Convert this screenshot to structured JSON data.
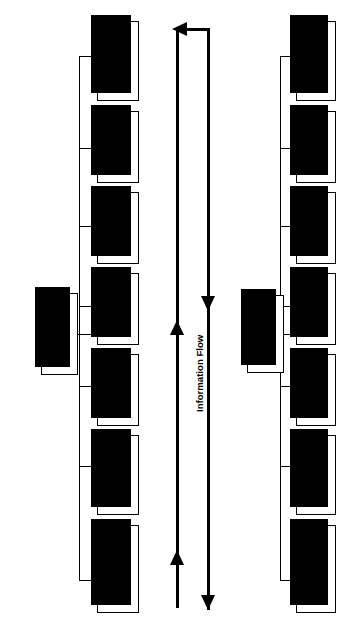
{
  "diagram": {
    "orientation": "rotated-90",
    "flow_label": "Information Flow",
    "transmitter": {
      "group_label": "Transmitter",
      "blocks": [
        {
          "label": "Transmitting\nAntenna"
        },
        {
          "label": "RF\nTransmitter"
        },
        {
          "label": "Up-\nConverter"
        },
        {
          "label": "IF\nTransmitter"
        },
        {
          "label": "Modulator"
        },
        {
          "label": "Code-\nInterleaver"
        },
        {
          "label": "Baseband\nProcessor"
        }
      ]
    },
    "receiver": {
      "group_label": "Receiver",
      "blocks": [
        {
          "label": "Receiving\nAntenna"
        },
        {
          "label": "RF\nReceiver"
        },
        {
          "label": "Down-\nConverter"
        },
        {
          "label": "IF\nReceiver"
        },
        {
          "label": "Demodulator"
        },
        {
          "label": "Decoder-\nDeinterleaver"
        },
        {
          "label": "Baseband\nProcessor"
        }
      ]
    },
    "colors": {
      "stroke": "#000000",
      "fill": "#ffffff",
      "shadow": "#000000",
      "background": "#ffffff"
    }
  }
}
